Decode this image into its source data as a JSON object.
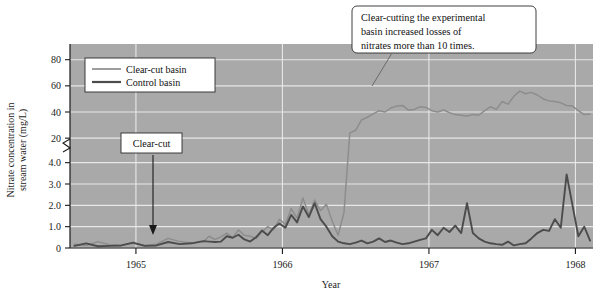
{
  "chart_data": {
    "type": "line",
    "title": "",
    "xlabel": "Year",
    "ylabel": "Nitrate concentration in stream water (mg/L)",
    "grid": true,
    "legend_position": "top-left-inside",
    "axis_break": {
      "present": true,
      "between": [
        4.0,
        20
      ],
      "symbol": "zigzag"
    },
    "x_ticks": [
      1965,
      1966,
      1967,
      1968
    ],
    "x_tick_labels": [
      "1965",
      "1966",
      "1967",
      "1968"
    ],
    "xlim": [
      1964.55,
      1968.12
    ],
    "y_ticks_lower": [
      0,
      1.0,
      2.0,
      3.0,
      4.0
    ],
    "y_tick_labels_lower": [
      "0",
      "1.0",
      "2.0",
      "3.0",
      "4.0"
    ],
    "y_ticks_upper": [
      20,
      40,
      60,
      80
    ],
    "y_tick_labels_upper": [
      "20",
      "40",
      "60",
      "80"
    ],
    "ylim_lower": [
      0,
      4.5
    ],
    "ylim_upper": [
      14,
      92
    ],
    "series": [
      {
        "name": "Clear-cut basin",
        "color": "#8d8d8d",
        "width": 1.5,
        "x": [
          1964.58,
          1964.66,
          1964.74,
          1964.82,
          1964.9,
          1964.98,
          1965.06,
          1965.14,
          1965.22,
          1965.3,
          1965.38,
          1965.46,
          1965.5,
          1965.54,
          1965.58,
          1965.62,
          1965.66,
          1965.7,
          1965.74,
          1965.78,
          1965.82,
          1965.86,
          1965.9,
          1965.94,
          1965.98,
          1966.02,
          1966.06,
          1966.1,
          1966.14,
          1966.18,
          1966.22,
          1966.26,
          1966.3,
          1966.34,
          1966.38,
          1966.42,
          1966.46,
          1966.5,
          1966.54,
          1966.58,
          1966.62,
          1966.66,
          1966.7,
          1966.74,
          1966.78,
          1966.82,
          1966.86,
          1966.9,
          1966.94,
          1966.98,
          1967.02,
          1967.06,
          1967.1,
          1967.14,
          1967.18,
          1967.22,
          1967.26,
          1967.3,
          1967.34,
          1967.38,
          1967.42,
          1967.46,
          1967.5,
          1967.54,
          1967.58,
          1967.62,
          1967.66,
          1967.7,
          1967.74,
          1967.78,
          1967.82,
          1967.86,
          1967.9,
          1967.94,
          1967.98,
          1968.02,
          1968.06,
          1968.1
        ],
        "y": [
          0.18,
          0.12,
          0.3,
          0.15,
          0.12,
          0.22,
          0.12,
          0.18,
          0.45,
          0.3,
          0.22,
          0.3,
          0.55,
          0.4,
          0.52,
          0.7,
          0.48,
          0.85,
          0.6,
          0.55,
          0.45,
          0.75,
          1.0,
          0.85,
          1.35,
          1.1,
          1.85,
          1.4,
          2.35,
          1.55,
          2.25,
          1.75,
          2.05,
          1.25,
          0.6,
          1.65,
          24.0,
          26.0,
          34.0,
          36.0,
          38.5,
          41.0,
          40.0,
          43.0,
          44.5,
          45.0,
          41.5,
          42.0,
          44.0,
          43.5,
          41.0,
          40.0,
          41.5,
          39.5,
          38.0,
          37.5,
          37.0,
          38.0,
          37.5,
          41.0,
          44.0,
          42.0,
          48.0,
          46.0,
          52.0,
          56.0,
          54.0,
          55.0,
          53.0,
          50.0,
          48.5,
          48.0,
          47.0,
          45.0,
          44.5,
          41.0,
          38.0,
          38.5
        ]
      },
      {
        "name": "Control basin",
        "color": "#4c4c4c",
        "width": 1.9,
        "x": [
          1964.58,
          1964.66,
          1964.74,
          1964.82,
          1964.9,
          1964.98,
          1965.06,
          1965.14,
          1965.22,
          1965.3,
          1965.38,
          1965.46,
          1965.5,
          1965.54,
          1965.58,
          1965.62,
          1965.66,
          1965.7,
          1965.74,
          1965.78,
          1965.82,
          1965.86,
          1965.9,
          1965.94,
          1965.98,
          1966.02,
          1966.06,
          1966.1,
          1966.14,
          1966.18,
          1966.22,
          1966.26,
          1966.3,
          1966.34,
          1966.38,
          1966.42,
          1966.46,
          1966.5,
          1966.54,
          1966.58,
          1966.62,
          1966.66,
          1966.7,
          1966.74,
          1966.78,
          1966.82,
          1966.86,
          1966.9,
          1966.94,
          1966.98,
          1967.02,
          1967.06,
          1967.1,
          1967.14,
          1967.18,
          1967.22,
          1967.26,
          1967.3,
          1967.34,
          1967.38,
          1967.42,
          1967.46,
          1967.5,
          1967.54,
          1967.58,
          1967.62,
          1967.66,
          1967.7,
          1967.74,
          1967.78,
          1967.82,
          1967.86,
          1967.9,
          1967.94,
          1967.98,
          1968.02,
          1968.06,
          1968.1
        ],
        "y": [
          0.1,
          0.22,
          0.08,
          0.1,
          0.12,
          0.25,
          0.1,
          0.12,
          0.28,
          0.18,
          0.22,
          0.32,
          0.3,
          0.28,
          0.3,
          0.55,
          0.48,
          0.62,
          0.4,
          0.3,
          0.5,
          0.82,
          0.6,
          0.95,
          1.15,
          0.95,
          1.55,
          1.2,
          1.95,
          1.45,
          2.1,
          1.35,
          1.0,
          0.55,
          0.3,
          0.22,
          0.18,
          0.25,
          0.35,
          0.22,
          0.3,
          0.45,
          0.28,
          0.35,
          0.25,
          0.18,
          0.22,
          0.3,
          0.38,
          0.45,
          0.85,
          0.6,
          0.95,
          0.75,
          1.05,
          0.7,
          2.1,
          0.7,
          0.45,
          0.3,
          0.22,
          0.18,
          0.15,
          0.3,
          0.12,
          0.18,
          0.22,
          0.45,
          0.7,
          0.85,
          0.8,
          1.35,
          0.95,
          3.45,
          2.0,
          0.55,
          1.0,
          0.35
        ]
      }
    ],
    "annotations": [
      {
        "name": "clear-cut-marker",
        "label": "Clear-cut",
        "x": 1965.42,
        "arrow": "down"
      },
      {
        "name": "callout",
        "lines": [
          "Clear-cutting the experimental",
          "basin increased losses of",
          "nitrates more than 10 times."
        ]
      }
    ]
  },
  "legend": {
    "items": [
      {
        "label": "Clear-cut basin",
        "color": "#8d8d8d"
      },
      {
        "label": "Control basin",
        "color": "#4c4c4c"
      }
    ]
  },
  "colors": {
    "plot_background": "#a9a9a9",
    "grid": "#e8e8e8",
    "axis": "#1a1a1a",
    "clear_cut_series": "#8d8d8d",
    "control_series": "#4c4c4c",
    "box_fill": "#ffffff",
    "page_background": "#ffffff"
  }
}
